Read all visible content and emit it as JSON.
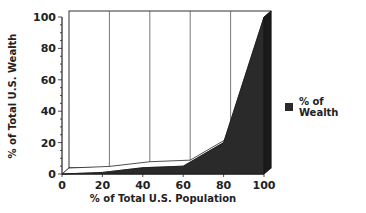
{
  "chart_data": {
    "type": "area",
    "title": "",
    "xlabel": "% of Total U.S. Population",
    "ylabel": "% of Total U.S. Wealth",
    "x": [
      0,
      20,
      40,
      60,
      80,
      100
    ],
    "series": [
      {
        "name": "% of Wealth",
        "values": [
          0,
          1,
          4,
          5,
          20,
          100
        ],
        "color": "#2a2a2a"
      }
    ],
    "xticks": [
      "0",
      "20",
      "40",
      "60",
      "80",
      "100"
    ],
    "yticks": [
      "0",
      "20",
      "40",
      "60",
      "80",
      "100"
    ],
    "xlim": [
      0,
      100
    ],
    "ylim": [
      0,
      100
    ],
    "grid": "vertical",
    "legend_position": "right",
    "style": "3d"
  },
  "legend": {
    "label": "% of Wealth"
  }
}
